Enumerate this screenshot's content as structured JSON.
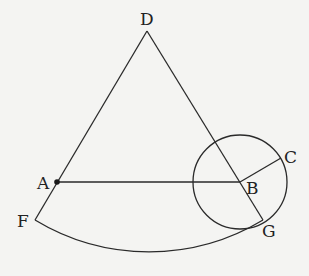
{
  "diagram": {
    "type": "geometry",
    "points": {
      "D": {
        "label": "D",
        "x": 147,
        "y": 31
      },
      "A": {
        "label": "A",
        "x": 57,
        "y": 182
      },
      "F": {
        "label": "F",
        "x": 35,
        "y": 220
      },
      "B": {
        "label": "B",
        "x": 240,
        "y": 181
      },
      "C": {
        "label": "C",
        "x": 281,
        "y": 158
      },
      "G": {
        "label": "G",
        "x": 263,
        "y": 220
      }
    },
    "labels": {
      "D": "D",
      "A": "A",
      "F": "F",
      "B": "B",
      "C": "C",
      "G": "G"
    },
    "segments": [
      "DF",
      "DG",
      "AB",
      "BC"
    ],
    "circles": [
      {
        "center": "B",
        "radius": 47
      }
    ],
    "arcs": [
      {
        "from": "F",
        "to": "G",
        "center": "D"
      }
    ],
    "marked_points": [
      "A"
    ],
    "colors": {
      "stroke": "#2a2a2a",
      "background": "#f4f4f2"
    }
  }
}
